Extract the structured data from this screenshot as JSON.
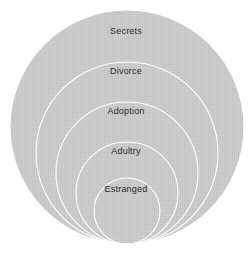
{
  "figure": {
    "type": "nested-circles-diagram",
    "background_color": "#ffffff",
    "fill_color": "#c8c8c8",
    "outline_color": "#ffffff",
    "label_color": "#2b2b2b",
    "tangent_point": {
      "x": 127,
      "y": 244
    }
  },
  "chart_data": {
    "type": "pie",
    "title": "",
    "xlabel": "",
    "ylabel": "",
    "categories": [
      "Secrets",
      "Divorce",
      "Adoption",
      "Adultry",
      "Estranged"
    ],
    "values": [
      117,
      91,
      71,
      51,
      33
    ],
    "series": [
      {
        "name": "radius",
        "values": [
          117,
          91,
          71,
          51,
          33
        ]
      }
    ],
    "legend_position": "none",
    "grid": false,
    "annotations": [
      "Secrets",
      "Divorce",
      "Adoption",
      "Adultry",
      "Estranged"
    ]
  },
  "rings": [
    {
      "label": "Secrets",
      "cx": 127,
      "cy": 127,
      "r": 117,
      "label_x": 126,
      "label_y": 31
    },
    {
      "label": "Divorce",
      "cx": 127,
      "cy": 153,
      "r": 91,
      "label_x": 126,
      "label_y": 71
    },
    {
      "label": "Adoption",
      "cx": 127,
      "cy": 173,
      "r": 71,
      "label_x": 126,
      "label_y": 111
    },
    {
      "label": "Adultry",
      "cx": 127,
      "cy": 193,
      "r": 51,
      "label_x": 126,
      "label_y": 151
    },
    {
      "label": "Estranged",
      "cx": 127,
      "cy": 211,
      "r": 33,
      "label_x": 126,
      "label_y": 189
    }
  ]
}
